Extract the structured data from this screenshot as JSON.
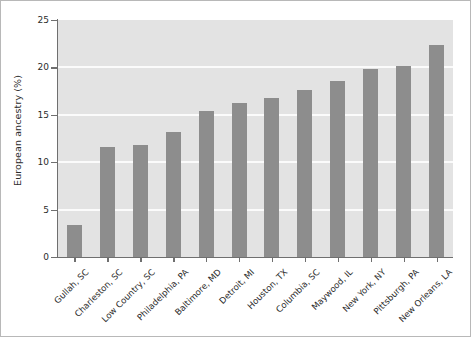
{
  "chart_data": {
    "type": "bar",
    "title": "",
    "xlabel": "",
    "ylabel": "European ancestry (%)",
    "categories": [
      "Gullah, SC",
      "Charleston, SC",
      "Low Country, SC",
      "Philadelphia, PA",
      "Baltimore, MD",
      "Detroit, MI",
      "Houston, TX",
      "Columbia, SC",
      "Maywood, IL",
      "New York, NY",
      "Pittsburgh, PA",
      "New Orleans, LA"
    ],
    "values": [
      3.4,
      11.6,
      11.8,
      13.2,
      15.4,
      16.2,
      16.8,
      17.6,
      18.6,
      19.8,
      20.2,
      22.4
    ],
    "ylim": [
      0,
      25
    ],
    "yticks": [
      0,
      5,
      10,
      15,
      20,
      25
    ],
    "ytick_labels": [
      "0",
      "5",
      "10",
      "15",
      "20",
      "25"
    ],
    "grid": true,
    "legend": false,
    "colors": {
      "bar": "#8d8d8d",
      "plot_background": "#e3e3e3",
      "gridline": "#fbfbfb",
      "axis": "#6f6f6f",
      "text": "#2b2b2b",
      "figure_background": "#ffffff"
    }
  }
}
